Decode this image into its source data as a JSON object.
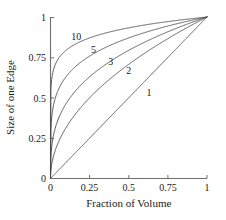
{
  "chart_data": {
    "type": "line",
    "title": "",
    "xlabel": "Fraction of Volume",
    "ylabel": "Size of one Edge",
    "xlim": [
      0,
      1
    ],
    "ylim": [
      0,
      1
    ],
    "grid": false,
    "legend_position": "inline-curve-labels",
    "xticks": [
      "0",
      "0.25",
      "0.5",
      "0.75",
      "1"
    ],
    "xtick_values": [
      0,
      0.25,
      0.5,
      0.75,
      1
    ],
    "yticks": [
      "0",
      "0.25",
      "0.5",
      "0.75",
      "1"
    ],
    "ytick_values": [
      0,
      0.25,
      0.5,
      0.75,
      1
    ],
    "formula": "y = x^(1/n)",
    "x": [
      0,
      0.01,
      0.02,
      0.04,
      0.06,
      0.08,
      0.1,
      0.15,
      0.2,
      0.25,
      0.3,
      0.35,
      0.4,
      0.45,
      0.5,
      0.55,
      0.6,
      0.65,
      0.7,
      0.75,
      0.8,
      0.85,
      0.9,
      0.95,
      1
    ],
    "series": [
      {
        "name": "1",
        "n": 1,
        "label": "1",
        "label_x": 0.63,
        "label_y": 0.51,
        "values": [
          0,
          0.01,
          0.02,
          0.04,
          0.06,
          0.08,
          0.1,
          0.15,
          0.2,
          0.25,
          0.3,
          0.35,
          0.4,
          0.45,
          0.5,
          0.55,
          0.6,
          0.65,
          0.7,
          0.75,
          0.8,
          0.85,
          0.9,
          0.95,
          1
        ]
      },
      {
        "name": "2",
        "n": 2,
        "label": "2",
        "label_x": 0.5,
        "label_y": 0.645,
        "values": [
          0,
          0.1,
          0.141,
          0.2,
          0.245,
          0.283,
          0.316,
          0.387,
          0.447,
          0.5,
          0.548,
          0.592,
          0.632,
          0.671,
          0.707,
          0.742,
          0.775,
          0.806,
          0.837,
          0.866,
          0.894,
          0.922,
          0.949,
          0.975,
          1
        ]
      },
      {
        "name": "3",
        "n": 3,
        "label": "3",
        "label_x": 0.385,
        "label_y": 0.705,
        "values": [
          0,
          0.215,
          0.271,
          0.342,
          0.391,
          0.43,
          0.464,
          0.531,
          0.585,
          0.63,
          0.669,
          0.705,
          0.737,
          0.766,
          0.794,
          0.819,
          0.843,
          0.866,
          0.888,
          0.909,
          0.928,
          0.947,
          0.965,
          0.983,
          1
        ]
      },
      {
        "name": "5",
        "n": 5,
        "label": "5",
        "label_x": 0.275,
        "label_y": 0.78,
        "values": [
          0,
          0.398,
          0.457,
          0.525,
          0.57,
          0.603,
          0.631,
          0.684,
          0.725,
          0.758,
          0.786,
          0.811,
          0.833,
          0.853,
          0.871,
          0.888,
          0.903,
          0.918,
          0.931,
          0.944,
          0.956,
          0.968,
          0.979,
          0.99,
          1
        ]
      },
      {
        "name": "10",
        "n": 10,
        "label": "10",
        "label_x": 0.165,
        "label_y": 0.855,
        "values": [
          0,
          0.631,
          0.676,
          0.724,
          0.755,
          0.777,
          0.794,
          0.827,
          0.851,
          0.871,
          0.887,
          0.9,
          0.912,
          0.923,
          0.933,
          0.942,
          0.95,
          0.958,
          0.965,
          0.972,
          0.978,
          0.984,
          0.99,
          0.995,
          1
        ]
      }
    ]
  },
  "axes": {
    "x_title": "Fraction of Volume",
    "y_title": "Size of one Edge"
  },
  "colors": {
    "curve": "#4a4a4a",
    "frame": "#6e6e6e",
    "text": "#1a1a1a",
    "background": "#ffffff"
  }
}
